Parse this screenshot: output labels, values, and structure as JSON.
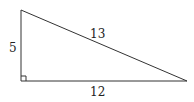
{
  "diagram": {
    "type": "right-triangle",
    "vertices": {
      "top": [
        21,
        10
      ],
      "right_angle": [
        21,
        81
      ],
      "right": [
        187,
        81
      ]
    },
    "labels": {
      "vertical_leg": "5",
      "hypotenuse": "13",
      "horizontal_leg": "12"
    },
    "right_angle_marker": true,
    "stroke_color": "#333333"
  }
}
